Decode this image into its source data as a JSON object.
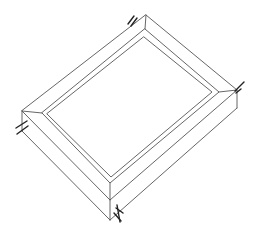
{
  "figure": {
    "width": 262,
    "height": 241,
    "line_color": "#555555",
    "fastener_color": "#222222",
    "background": "#ffffff",
    "fasteners": [
      {
        "corner": "top",
        "x": 133,
        "y": 20
      },
      {
        "corner": "right",
        "x": 240,
        "y": 88
      },
      {
        "corner": "left",
        "x": 20,
        "y": 128
      },
      {
        "corner": "bottom",
        "x": 118,
        "y": 212
      }
    ]
  }
}
